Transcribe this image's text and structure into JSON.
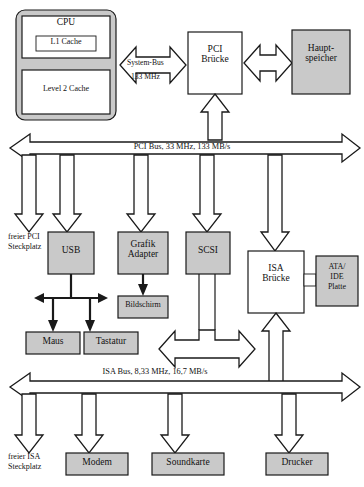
{
  "diagram": {
    "colors": {
      "fill_gray": "#c9c9c9",
      "fill_white": "#ffffff",
      "stroke": "#1a1a1a",
      "page_bg": "#ffffff"
    },
    "blocks": {
      "cpu_package": "",
      "cpu": "CPU",
      "l1_cache": "L1 Cache",
      "l2_cache": "Level 2 Cache",
      "pci_bridge": "PCI\nBrücke",
      "main_memory": "Haupt-\nspeicher",
      "usb": "USB",
      "grafik_adapter": "Grafik\nAdapter",
      "scsi": "SCSI",
      "isa_bridge": "ISA\nBrücke",
      "ata_ide": "ATA/\nIDE\nPlatte",
      "bildschirm": "Bildschirm",
      "maus": "Maus",
      "tastatur": "Tastatur",
      "modem": "Modem",
      "soundkarte": "Soundkarte",
      "drucker": "Drucker"
    },
    "bus_labels": {
      "system_bus": "System-Bus",
      "system_bus_speed": "133 MHz",
      "pci_bus": "PCI Bus, 33 MHz, 133 MB/s",
      "isa_bus": "ISA Bus, 8,33 MHz, 16,7 MB/s"
    },
    "slot_labels": {
      "free_pci": "freier PCI\nSteckplatz",
      "free_isa": "freier ISA\nSteckplatz"
    },
    "caption": ""
  }
}
